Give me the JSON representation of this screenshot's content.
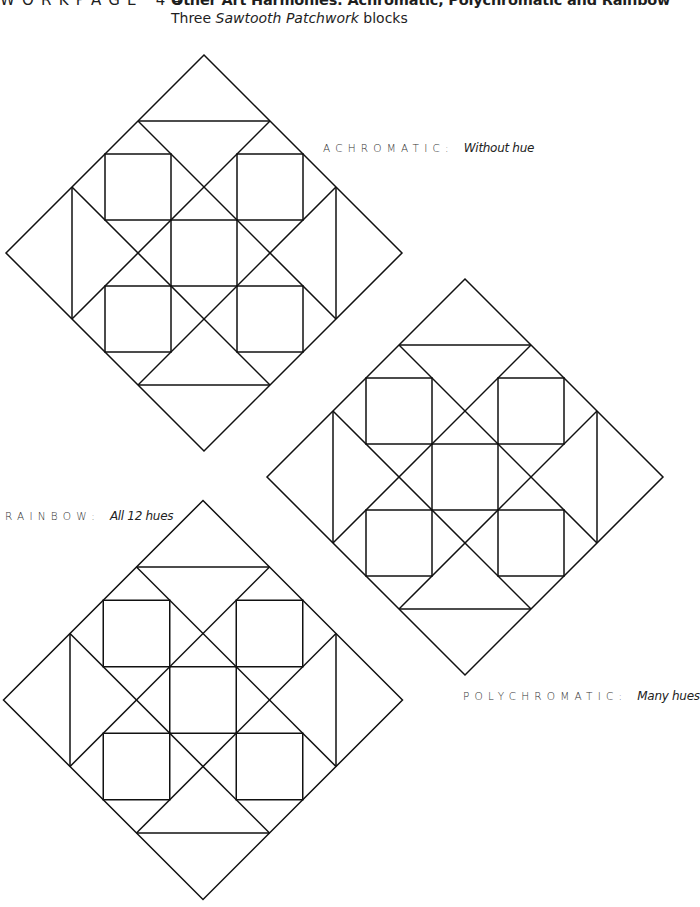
{
  "header": {
    "workpage_label": "WORKPAGE 44:",
    "title": "Other Art Harmonies: Achromatic, Polychromatic and Rainbow",
    "subtitle_prefix": "Three ",
    "subtitle_italic": "Sawtooth Patchwork",
    "subtitle_suffix": " blocks"
  },
  "blocks": [
    {
      "name": "achromatic-block",
      "cx": 204,
      "cy": 253,
      "u": 66,
      "label": {
        "caps": "ACHROMATIC:",
        "desc": "Without hue",
        "x": 323,
        "y": 141
      }
    },
    {
      "name": "polychromatic-block",
      "cx": 465,
      "cy": 477,
      "u": 66,
      "label": {
        "caps": "POLYCHROMATIC:",
        "desc": "Many hues",
        "x": 463,
        "y": 689
      }
    },
    {
      "name": "rainbow-block",
      "cx": 203,
      "cy": 700,
      "u": 66.5,
      "label": {
        "caps": "RAINBOW:",
        "desc": "All 12 hues",
        "x": 5,
        "y": 509
      }
    }
  ],
  "style": {
    "stroke_color": "#111111",
    "background": "#ffffff"
  }
}
